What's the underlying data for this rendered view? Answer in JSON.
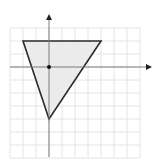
{
  "diagram": {
    "type": "coordinate-plane-triangle",
    "grid": {
      "x_min": -3,
      "x_max": 7,
      "y_min": -7,
      "y_max": 3,
      "spacing_px": 13,
      "color": "#e4e4e4"
    },
    "origin_px": [
      49,
      67
    ],
    "axes": {
      "color": "#7a7a7a",
      "arrow_color": "#222222"
    },
    "triangle": {
      "vertices": [
        [
          -2,
          2
        ],
        [
          4,
          2
        ],
        [
          0,
          -4
        ]
      ],
      "fill": "#ebebeb",
      "stroke": "#2a2a2a"
    },
    "origin_point": {
      "x": 0,
      "y": 0,
      "color": "#111111"
    }
  }
}
